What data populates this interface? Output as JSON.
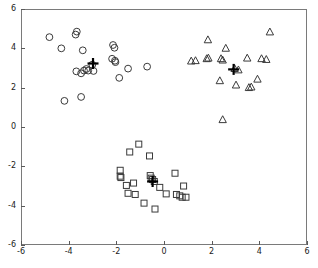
{
  "figure": {
    "name": "cluster-scatter-plot",
    "background": "#ffffff",
    "axis_color": "#7a7a7a",
    "marker_color": "#3a3a3a",
    "centroid_color": "#000000"
  },
  "chart_data": {
    "type": "scatter",
    "title": "",
    "xlabel": "",
    "ylabel": "",
    "xlim": [
      -6,
      6
    ],
    "ylim": [
      -6,
      6
    ],
    "xticks": [
      -6,
      -4,
      -2,
      0,
      2,
      4,
      6
    ],
    "yticks": [
      -6,
      -4,
      -2,
      0,
      2,
      4,
      6
    ],
    "xtick_labels": [
      "-6",
      "-4",
      "-2",
      "0",
      "2",
      "4",
      "6"
    ],
    "ytick_labels": [
      "-6",
      "-4",
      "-2",
      "0",
      "2",
      "4",
      "6"
    ],
    "grid": false,
    "legend": false,
    "legend_position": "none",
    "series": [
      {
        "name": "cluster-1",
        "marker": "circle",
        "color": "#3a3a3a",
        "points": [
          [
            -4.85,
            4.62
          ],
          [
            -4.35,
            4.05
          ],
          [
            -3.75,
            4.75
          ],
          [
            -3.7,
            4.9
          ],
          [
            -3.45,
            3.95
          ],
          [
            -3.72,
            2.88
          ],
          [
            -3.52,
            2.78
          ],
          [
            -3.4,
            2.92
          ],
          [
            -3.3,
            3.0
          ],
          [
            -3.22,
            2.92
          ],
          [
            -3.05,
            3.22
          ],
          [
            -3.0,
            2.9
          ],
          [
            -2.12,
            4.08
          ],
          [
            -2.18,
            4.22
          ],
          [
            -2.22,
            3.52
          ],
          [
            -2.1,
            3.42
          ],
          [
            -2.08,
            3.35
          ],
          [
            -1.92,
            2.55
          ],
          [
            -1.55,
            3.02
          ],
          [
            -0.75,
            3.12
          ],
          [
            -4.22,
            1.38
          ],
          [
            -3.52,
            1.58
          ]
        ],
        "centroid": [
          -3.02,
          3.28
        ]
      },
      {
        "name": "cluster-2",
        "marker": "triangle",
        "color": "#3a3a3a",
        "points": [
          [
            1.1,
            3.4
          ],
          [
            1.28,
            3.42
          ],
          [
            1.75,
            3.52
          ],
          [
            1.82,
            3.55
          ],
          [
            1.8,
            4.48
          ],
          [
            2.35,
            3.52
          ],
          [
            2.42,
            3.45
          ],
          [
            2.55,
            4.05
          ],
          [
            2.92,
            3.02
          ],
          [
            3.08,
            2.95
          ],
          [
            3.45,
            3.55
          ],
          [
            4.05,
            3.52
          ],
          [
            4.25,
            3.48
          ],
          [
            4.4,
            4.88
          ],
          [
            2.3,
            2.4
          ],
          [
            2.98,
            2.18
          ],
          [
            3.52,
            2.05
          ],
          [
            3.62,
            2.08
          ],
          [
            3.88,
            2.48
          ],
          [
            2.42,
            0.42
          ]
        ],
        "centroid": [
          2.88,
          2.98
        ]
      },
      {
        "name": "cluster-3",
        "marker": "square",
        "color": "#3a3a3a",
        "points": [
          [
            -1.1,
            -0.82
          ],
          [
            -1.48,
            -1.22
          ],
          [
            -0.65,
            -1.42
          ],
          [
            -1.88,
            -2.15
          ],
          [
            -1.88,
            -2.45
          ],
          [
            -1.85,
            -2.52
          ],
          [
            -1.62,
            -2.92
          ],
          [
            -1.32,
            -2.8
          ],
          [
            -1.55,
            -3.32
          ],
          [
            -1.25,
            -3.38
          ],
          [
            -0.62,
            -2.42
          ],
          [
            -0.58,
            -2.55
          ],
          [
            -0.52,
            -2.62
          ],
          [
            -0.45,
            -2.72
          ],
          [
            -0.22,
            -3.02
          ],
          [
            0.05,
            -3.35
          ],
          [
            0.42,
            -2.3
          ],
          [
            0.48,
            -3.38
          ],
          [
            0.62,
            -3.45
          ],
          [
            0.72,
            -3.52
          ],
          [
            0.78,
            -2.95
          ],
          [
            0.88,
            -3.52
          ],
          [
            -0.88,
            -3.82
          ],
          [
            -0.42,
            -4.12
          ]
        ],
        "centroid": [
          -0.52,
          -2.72
        ]
      }
    ]
  }
}
